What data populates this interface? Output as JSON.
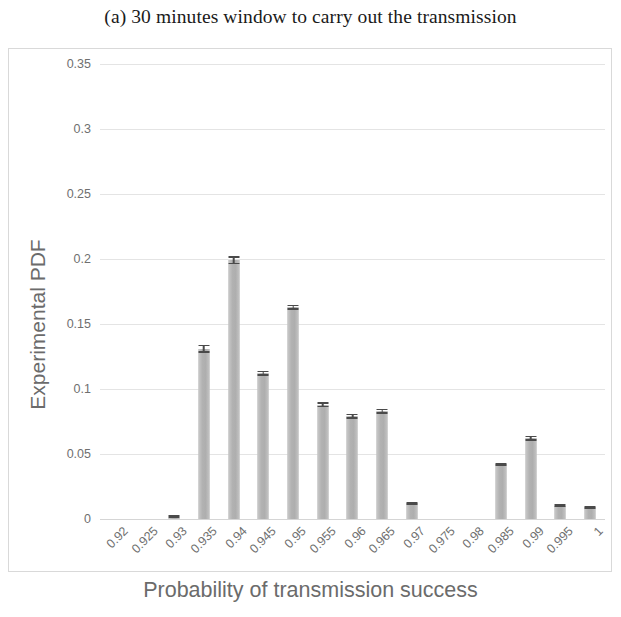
{
  "figure": {
    "caption": "(a) 30 minutes window to carry out the transmission"
  },
  "chart_data": {
    "type": "bar",
    "title": "(a) 30 minutes window to carry out the transmission",
    "xlabel": "Probability of transmission success",
    "ylabel": "Experimental PDF",
    "categories": [
      "0.92",
      "0.925",
      "0.93",
      "0.935",
      "0.94",
      "0.945",
      "0.95",
      "0.955",
      "0.96",
      "0.965",
      "0.97",
      "0.975",
      "0.98",
      "0.985",
      "0.99",
      "0.995",
      "1"
    ],
    "values": [
      0,
      0,
      0.001,
      0.131,
      0.199,
      0.112,
      0.163,
      0.088,
      0.079,
      0.083,
      0.012,
      0,
      0,
      0.042,
      0.062,
      0.01,
      0.009
    ],
    "errors": [
      0,
      0,
      0.0005,
      0.003,
      0.003,
      0.002,
      0.002,
      0.002,
      0.002,
      0.002,
      0.001,
      0,
      0,
      0.001,
      0.002,
      0.001,
      0.001
    ],
    "ylim": [
      0,
      0.35
    ],
    "yticks": [
      0,
      0.05,
      0.1,
      0.15,
      0.2,
      0.25,
      0.3,
      0.35
    ],
    "ytick_labels": [
      "0",
      "0.05",
      "0.1",
      "0.15",
      "0.2",
      "0.25",
      "0.3",
      "0.35"
    ],
    "grid": true,
    "legend": false,
    "bar_color": "#b7b7b7",
    "error_bar_color": "#4a4a4a",
    "grid_color": "#e4e4e4"
  }
}
